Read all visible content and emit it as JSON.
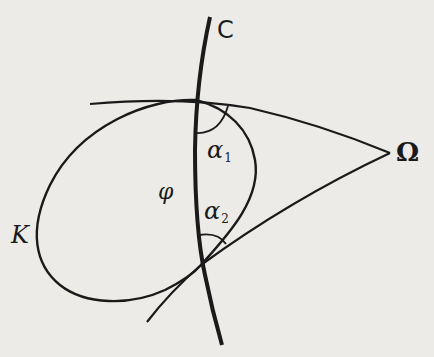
{
  "figure": {
    "type": "geometric diagram",
    "background_color": "#ecebe8",
    "stroke_color": "#1a1a1a",
    "labels": {
      "curve_C": "C",
      "point_omega": "Ω",
      "curve_K": "K",
      "angle_phi": "φ",
      "angle_alpha1": {
        "symbol": "α",
        "subscript": "1"
      },
      "angle_alpha2": {
        "symbol": "α",
        "subscript": "2"
      }
    },
    "elements": [
      "curve C (thick, nearly vertical)",
      "closed oval curve K",
      "two lines from intersection points converging at point Ω",
      "angle arc α1 at upper intersection",
      "angle arc α2 at lower intersection",
      "angle φ between C and K"
    ]
  }
}
